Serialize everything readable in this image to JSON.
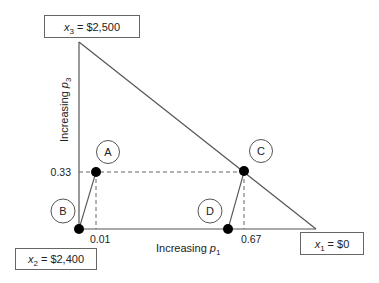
{
  "diagram": {
    "vertices": {
      "x3": {
        "var": "x",
        "sub": "3",
        "value": "= $2,500"
      },
      "x2": {
        "var": "x",
        "sub": "2",
        "value": "= $2,400"
      },
      "x1": {
        "var": "x",
        "sub": "1",
        "value": "= $0"
      }
    },
    "axes": {
      "vertical": {
        "prefix": "Increasing ",
        "var": "p",
        "sub": "3"
      },
      "horizontal": {
        "prefix": "Increasing ",
        "var": "p",
        "sub": "1"
      }
    },
    "ticks": {
      "y_033": "0.33",
      "x_001": "0.01",
      "x_067": "0.67"
    },
    "points": [
      {
        "label": "A"
      },
      {
        "label": "B"
      },
      {
        "label": "C"
      },
      {
        "label": "D"
      }
    ],
    "colors": {
      "line": "#555555",
      "point": "#000000",
      "box_border": "#666666"
    }
  }
}
